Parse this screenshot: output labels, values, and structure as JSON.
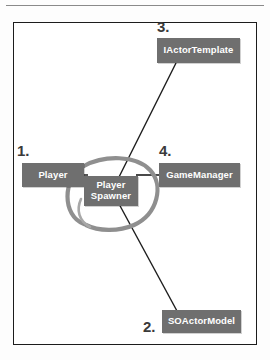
{
  "diagram": {
    "frame_border_color": "#1c1c1c",
    "background_color": "#ffffff",
    "node_fill_color": "#6f6f6f",
    "node_text_color": "#ffffff",
    "connector_color": "#1c1c1c",
    "highlight_ellipse_color": "#8f8f8f",
    "nodes": [
      {
        "id": "player",
        "label": "Player",
        "callout": "1."
      },
      {
        "id": "spawner",
        "label_line1": "Player",
        "label_line2": "Spawner",
        "callout": ""
      },
      {
        "id": "soactormodel",
        "label": "SOActorModel",
        "callout": "2."
      },
      {
        "id": "iactortemplate",
        "label": "IActorTemplate",
        "callout": "3."
      },
      {
        "id": "gamemanager",
        "label": "GameManager",
        "callout": "4."
      }
    ],
    "callouts": {
      "one": "1.",
      "two": "2.",
      "three": "3.",
      "four": "4."
    },
    "connections": [
      {
        "from": "player",
        "to": "spawner"
      },
      {
        "from": "spawner",
        "to": "gamemanager"
      },
      {
        "from": "spawner",
        "to": "iactortemplate"
      },
      {
        "from": "spawner",
        "to": "soactormodel"
      }
    ],
    "highlight": {
      "target": "spawner",
      "shape": "hand-drawn-ellipse"
    }
  }
}
